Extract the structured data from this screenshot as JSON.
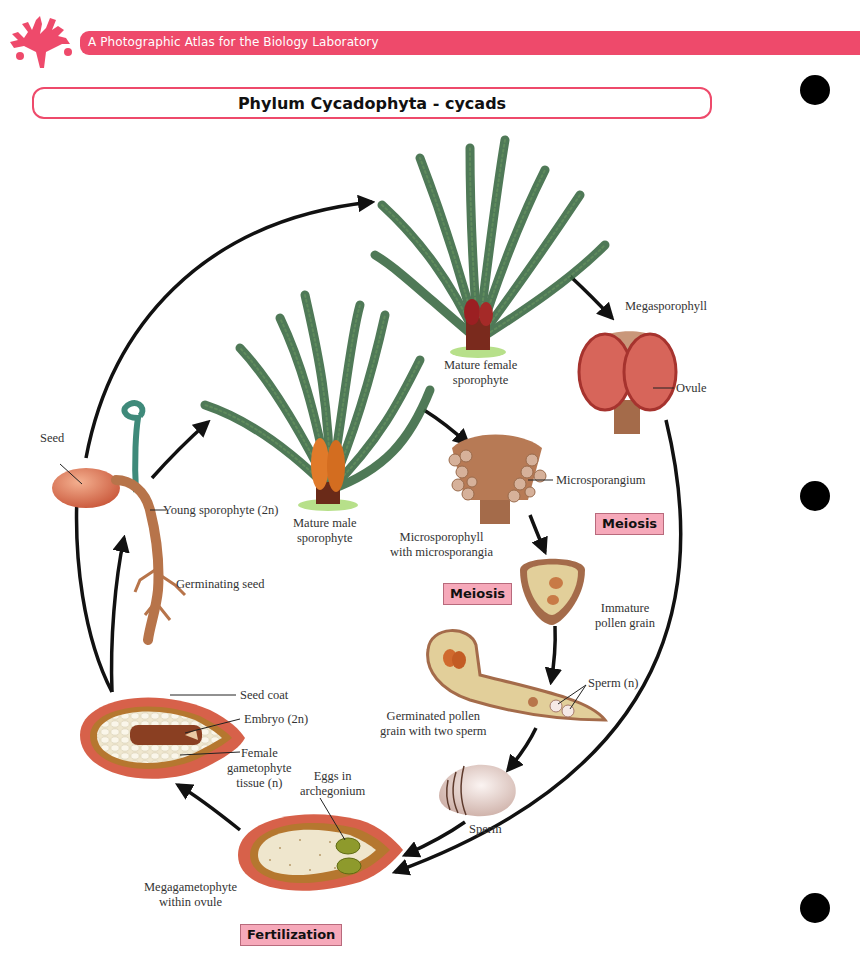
{
  "header": {
    "book_title": "A Photographic Atlas for the Biology Laboratory",
    "logo_icon": "coral-icon",
    "accent_color": "#ee4a6b"
  },
  "page_title": "Phylum Cycadophyta - cycads",
  "binder_holes": 3,
  "stages": {
    "mature_female": "Mature female\nsporophyte",
    "megasporophyll": "Megasporophyll",
    "ovule": "Ovule",
    "seed": "Seed",
    "young_sporophyte": "Young sporophyte (2n)",
    "germinating_seed": "Germinating seed",
    "mature_male": "Mature male\nsporophyte",
    "microsporangium": "Microsporangium",
    "microsporophyll": "Microsporophyll\nwith microsporangia",
    "immature_pollen": "Immature\npollen grain",
    "sperm_n": "Sperm (n)",
    "germinated_pollen": "Germinated pollen\ngrain with two sperm",
    "sperm": "Sperm",
    "seed_coat": "Seed coat",
    "embryo": "Embryo (2n)",
    "female_gametophyte": "Female\ngametophyte\ntissue (n)",
    "eggs": "Eggs in\narchegonium",
    "megagametophyte": "Megagametophyte\nwithin ovule"
  },
  "process_badges": {
    "meiosis_right": "Meiosis",
    "meiosis_left": "Meiosis",
    "fertilization": "Fertilization"
  },
  "colors": {
    "badge_fill": "#f6a9ba",
    "frond_green": "#3d6b45",
    "ovule_red": "#d9614e",
    "tissue_tan": "#ead9a8"
  }
}
